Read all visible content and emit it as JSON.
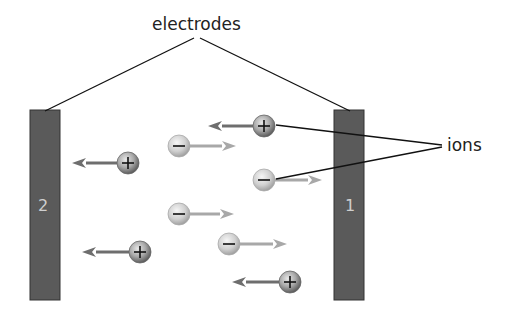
{
  "labels": {
    "electrodes": "electrodes",
    "ions": "ions",
    "electrode_left": "2",
    "electrode_right": "1"
  },
  "colors": {
    "electrode": "#5a5a5a",
    "positive_arrow": "#6e6e6e",
    "negative_arrow": "#a8a8a8",
    "line": "#111111"
  },
  "ions": [
    {
      "sign": "+",
      "x": 264,
      "y": 126,
      "arrow_to": 208
    },
    {
      "sign": "−",
      "x": 179,
      "y": 146,
      "arrow_to": 236
    },
    {
      "sign": "+",
      "x": 128,
      "y": 163,
      "arrow_to": 72
    },
    {
      "sign": "−",
      "x": 264,
      "y": 180,
      "arrow_to": 322
    },
    {
      "sign": "−",
      "x": 179,
      "y": 214,
      "arrow_to": 234
    },
    {
      "sign": "−",
      "x": 229,
      "y": 244,
      "arrow_to": 287
    },
    {
      "sign": "+",
      "x": 140,
      "y": 252,
      "arrow_to": 82
    },
    {
      "sign": "+",
      "x": 290,
      "y": 282,
      "arrow_to": 232
    }
  ]
}
